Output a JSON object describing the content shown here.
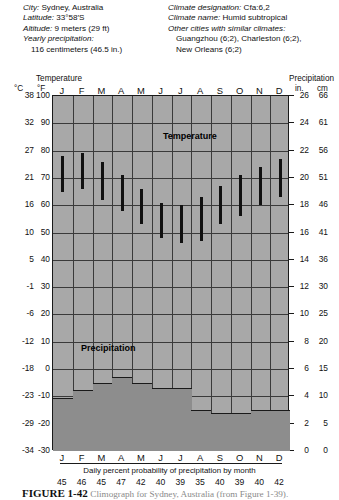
{
  "header": {
    "left": [
      {
        "label": "City:",
        "value": " Sydney, Australia"
      },
      {
        "label": "Latitude:",
        "value": " 33°58′S"
      },
      {
        "label": "Altitude:",
        "value": " 9 meters (29 ft)"
      },
      {
        "label": "Yearly precipitation:",
        "value": ""
      },
      {
        "label": "",
        "value": "116 centimeters (46.5 in.)"
      }
    ],
    "right": [
      {
        "label": "Climate designation:",
        "value": " Cfa:6,2"
      },
      {
        "label": "Climate name:",
        "value": " Humid subtropical"
      },
      {
        "label": "Other cities with similar climates:",
        "value": ""
      },
      {
        "label": "",
        "value": "Guangzhou (6;2), Charleston (6;2),"
      },
      {
        "label": "",
        "value": "New Orleans (6;2)"
      }
    ]
  },
  "axes": {
    "temperature_caption": "Temperature",
    "precipitation_caption": "Precipitation",
    "unit_celsius": "°C",
    "unit_fahrenheit": "°F",
    "unit_inches": "in.",
    "unit_centimeters": "cm"
  },
  "plot_labels": {
    "temperature": "Temperature",
    "precipitation": "Precipitation"
  },
  "footer": {
    "probability_caption": "Daily percent probability of precipitation by month",
    "figure_number": "FIGURE 1-42",
    "figure_text": "Climograph for Sydney, Australia (from Figure 1-39)."
  },
  "chart_data": {
    "type": "bar",
    "title": "Climograph for Sydney, Australia",
    "subtitle": "Humid subtropical (Cfa:6,2)",
    "xlabel": "",
    "ylabel": "Temperature / Precipitation",
    "grid": true,
    "legend_position": "in-plot",
    "categories": [
      "J",
      "F",
      "M",
      "A",
      "M",
      "J",
      "J",
      "A",
      "S",
      "O",
      "N",
      "D"
    ],
    "month_labels_top": [
      "J",
      "F",
      "M",
      "A",
      "M",
      "J",
      "J",
      "A",
      "S",
      "O",
      "N",
      "D"
    ],
    "month_labels_bottom": [
      "J",
      "F",
      "M",
      "A",
      "M",
      "J",
      "J",
      "A",
      "S",
      "O",
      "N",
      "D"
    ],
    "axis_temperature": {
      "celsius_ticks": [
        38,
        32,
        27,
        21,
        16,
        10,
        5,
        -1,
        -6,
        -12,
        -18,
        -23,
        -29,
        -34
      ],
      "fahrenheit_ticks": [
        100,
        90,
        80,
        70,
        60,
        50,
        40,
        30,
        20,
        10,
        0,
        -10,
        -20,
        -30
      ],
      "ylim_f": [
        -30,
        100
      ]
    },
    "axis_precipitation": {
      "inches_ticks": [
        26,
        24,
        22,
        20,
        18,
        16,
        14,
        12,
        10,
        8,
        6,
        4,
        2,
        0
      ],
      "centimeters_ticks": [
        66,
        61,
        56,
        51,
        46,
        41,
        36,
        30,
        25,
        20,
        15,
        10,
        5,
        0
      ],
      "ylim_in": [
        0,
        26
      ]
    },
    "series": [
      {
        "name": "Temperature range (°F high/low)",
        "type": "range-bar",
        "units": "°F",
        "highs": [
          78,
          79,
          76,
          71,
          66,
          61,
          60,
          63,
          67,
          71,
          74,
          77
        ],
        "lows": [
          65,
          66,
          62,
          58,
          53,
          48,
          46,
          47,
          53,
          56,
          60,
          63
        ]
      },
      {
        "name": "Precipitation",
        "type": "step-area",
        "units": "in.",
        "values_in": [
          3.9,
          4.5,
          5.0,
          5.4,
          5.0,
          4.6,
          4.6,
          3.0,
          2.8,
          2.8,
          3.0,
          3.0
        ],
        "values_cm": [
          10,
          11,
          13,
          14,
          13,
          12,
          12,
          8,
          7,
          7,
          8,
          8
        ]
      }
    ],
    "daily_percent_probability": [
      45,
      46,
      45,
      47,
      42,
      40,
      39,
      35,
      40,
      39,
      40,
      42
    ]
  }
}
